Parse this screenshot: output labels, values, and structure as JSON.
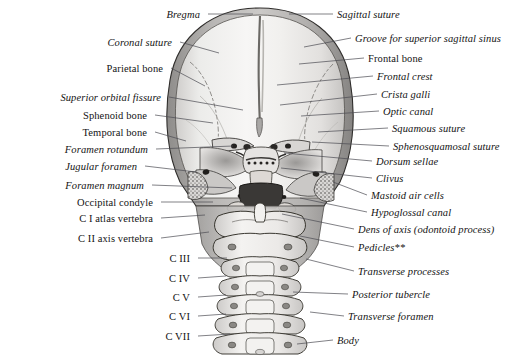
{
  "figure": {
    "background_color": "#ffffff",
    "ink_color": "#131313",
    "leader_color": "#4a4a52",
    "bone_fill": "#f2f1ef",
    "bone_shadow": "#b8b6b4",
    "bone_dark": "#8d8b89",
    "width": 528,
    "height": 361
  },
  "labels_left": [
    {
      "id": "bregma",
      "text": "Bregma",
      "style": "italic",
      "tx": 200,
      "ty": 17,
      "lx1": 208,
      "ly1": 14,
      "lx2": 253,
      "ly2": 14
    },
    {
      "id": "coronal-suture",
      "text": "Coronal suture",
      "style": "italic",
      "tx": 172,
      "ty": 45,
      "lx1": 180,
      "ly1": 42,
      "lx2": 219,
      "ly2": 53
    },
    {
      "id": "parietal-bone",
      "text": "Parietal bone",
      "style": "roman",
      "tx": 163,
      "ty": 71,
      "lx1": 171,
      "ly1": 68,
      "lx2": 205,
      "ly2": 86
    },
    {
      "id": "superior-orbital-fissure",
      "text": "Superior orbital fissure",
      "style": "italic",
      "tx": 161,
      "ty": 100,
      "lx1": 169,
      "ly1": 97,
      "lx2": 243,
      "ly2": 110
    },
    {
      "id": "sphenoid-bone",
      "text": "Sphenoid bone",
      "style": "roman",
      "tx": 147,
      "ty": 118,
      "lx1": 155,
      "ly1": 115,
      "lx2": 213,
      "ly2": 123
    },
    {
      "id": "temporal-bone",
      "text": "Temporal bone",
      "style": "roman",
      "tx": 147,
      "ty": 135,
      "lx1": 155,
      "ly1": 132,
      "lx2": 186,
      "ly2": 141
    },
    {
      "id": "foramen-rotundum",
      "text": "Foramen rotundum",
      "style": "italic",
      "tx": 148,
      "ty": 152,
      "lx1": 156,
      "ly1": 149,
      "lx2": 233,
      "ly2": 146
    },
    {
      "id": "jugular-foramen",
      "text": "Jugular foramen",
      "style": "italic",
      "tx": 137,
      "ty": 169,
      "lx1": 145,
      "ly1": 166,
      "lx2": 196,
      "ly2": 172
    },
    {
      "id": "foramen-magnum",
      "text": "Foramen magnum",
      "style": "italic",
      "tx": 144,
      "ty": 188,
      "lx1": 152,
      "ly1": 185,
      "lx2": 232,
      "ly2": 188
    },
    {
      "id": "occipital-condyle",
      "text": "Occipital condyle",
      "style": "roman",
      "tx": 153,
      "ty": 205,
      "lx1": 161,
      "ly1": 202,
      "lx2": 213,
      "ly2": 202
    },
    {
      "id": "c1-atlas",
      "text": "C I atlas vertebra",
      "style": "roman",
      "tx": 153,
      "ty": 221,
      "lx1": 161,
      "ly1": 218,
      "lx2": 205,
      "ly2": 215
    },
    {
      "id": "c2-axis",
      "text": "C II axis vertebra",
      "style": "roman",
      "tx": 153,
      "ty": 241,
      "lx1": 161,
      "ly1": 238,
      "lx2": 209,
      "ly2": 232
    },
    {
      "id": "c3",
      "text": "C III",
      "style": "roman",
      "tx": 190,
      "ty": 261,
      "lx1": 198,
      "ly1": 258,
      "lx2": 227,
      "ly2": 258
    },
    {
      "id": "c4",
      "text": "C IV",
      "style": "roman",
      "tx": 190,
      "ty": 281,
      "lx1": 198,
      "ly1": 278,
      "lx2": 226,
      "ly2": 276
    },
    {
      "id": "c5",
      "text": "C V",
      "style": "roman",
      "tx": 190,
      "ty": 300,
      "lx1": 198,
      "ly1": 297,
      "lx2": 226,
      "ly2": 295
    },
    {
      "id": "c6",
      "text": "C VI",
      "style": "roman",
      "tx": 190,
      "ty": 319,
      "lx1": 198,
      "ly1": 316,
      "lx2": 226,
      "ly2": 314
    },
    {
      "id": "c7",
      "text": "C VII",
      "style": "roman",
      "tx": 190,
      "ty": 339,
      "lx1": 198,
      "ly1": 336,
      "lx2": 230,
      "ly2": 334
    }
  ],
  "labels_right": [
    {
      "id": "sagittal-suture",
      "text": "Sagittal suture",
      "style": "italic",
      "tx": 337,
      "ty": 17,
      "lx1": 333,
      "ly1": 14,
      "lx2": 289,
      "ly2": 14
    },
    {
      "id": "groove-sup-sagittal-sinus",
      "text": "Groove for superior sagittal sinus",
      "style": "italic",
      "tx": 355,
      "ty": 41,
      "lx1": 351,
      "ly1": 38,
      "lx2": 304,
      "ly2": 47
    },
    {
      "id": "frontal-bone",
      "text": "Frontal bone",
      "style": "roman",
      "tx": 368,
      "ty": 61,
      "lx1": 364,
      "ly1": 58,
      "lx2": 299,
      "ly2": 64
    },
    {
      "id": "frontal-crest",
      "text": "Frontal crest",
      "style": "italic",
      "tx": 377,
      "ty": 79,
      "lx1": 373,
      "ly1": 76,
      "lx2": 277,
      "ly2": 85
    },
    {
      "id": "crista-galli",
      "text": "Crista galli",
      "style": "italic",
      "tx": 381,
      "ty": 97,
      "lx1": 377,
      "ly1": 94,
      "lx2": 280,
      "ly2": 105
    },
    {
      "id": "optic-canal",
      "text": "Optic canal",
      "style": "italic",
      "tx": 383,
      "ty": 114,
      "lx1": 379,
      "ly1": 111,
      "lx2": 301,
      "ly2": 116
    },
    {
      "id": "squamous-suture",
      "text": "Squamous suture",
      "style": "italic",
      "tx": 392,
      "ty": 131,
      "lx1": 388,
      "ly1": 128,
      "lx2": 318,
      "ly2": 132
    },
    {
      "id": "sphenosquamosal-suture",
      "text": "Sphenosquamosal suture",
      "style": "italic",
      "tx": 393,
      "ty": 149,
      "lx1": 389,
      "ly1": 146,
      "lx2": 312,
      "ly2": 142
    },
    {
      "id": "dorsum-sellae",
      "text": "Dorsum sellae",
      "style": "italic",
      "tx": 376,
      "ty": 164,
      "lx1": 372,
      "ly1": 161,
      "lx2": 284,
      "ly2": 153
    },
    {
      "id": "clivus",
      "text": "Clivus",
      "style": "italic",
      "tx": 376,
      "ty": 181,
      "lx1": 372,
      "ly1": 178,
      "lx2": 281,
      "ly2": 168
    },
    {
      "id": "mastoid-air-cells",
      "text": "Mastoid air cells",
      "style": "italic",
      "tx": 371,
      "ty": 198,
      "lx1": 367,
      "ly1": 195,
      "lx2": 333,
      "ly2": 182
    },
    {
      "id": "hypoglossal-canal",
      "text": "Hypoglossal canal",
      "style": "italic",
      "tx": 371,
      "ty": 215,
      "lx1": 367,
      "ly1": 212,
      "lx2": 300,
      "ly2": 198
    },
    {
      "id": "dens-of-axis",
      "text": "Dens of axis (odontoid process)",
      "style": "italic",
      "tx": 358,
      "ty": 232,
      "lx1": 354,
      "ly1": 229,
      "lx2": 282,
      "ly2": 214
    },
    {
      "id": "pedicles",
      "text": "Pedicles**",
      "style": "italic",
      "tx": 358,
      "ty": 250,
      "lx1": 354,
      "ly1": 247,
      "lx2": 300,
      "ly2": 236
    },
    {
      "id": "transverse-processes",
      "text": "Transverse processes",
      "style": "italic",
      "tx": 358,
      "ty": 274,
      "lx1": 354,
      "ly1": 271,
      "lx2": 306,
      "ly2": 259
    },
    {
      "id": "posterior-tubercle",
      "text": "Posterior tubercle",
      "style": "italic",
      "tx": 352,
      "ty": 297,
      "lx1": 348,
      "ly1": 294,
      "lx2": 293,
      "ly2": 292
    },
    {
      "id": "transverse-foramen",
      "text": "Transverse foramen",
      "style": "italic",
      "tx": 348,
      "ty": 319,
      "lx1": 344,
      "ly1": 316,
      "lx2": 310,
      "ly2": 312
    },
    {
      "id": "body",
      "text": "Body",
      "style": "italic",
      "tx": 337,
      "ty": 343,
      "lx1": 333,
      "ly1": 340,
      "lx2": 297,
      "ly2": 344
    }
  ]
}
